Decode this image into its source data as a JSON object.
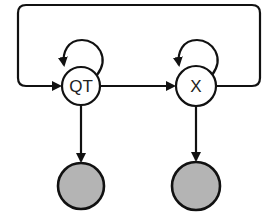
{
  "diagram": {
    "type": "graphical-model",
    "nodes": [
      {
        "id": "QT",
        "label": "QT",
        "kind": "hidden",
        "cx": 81,
        "cy": 86,
        "r": 19,
        "fill": "#ffffff"
      },
      {
        "id": "X",
        "label": "X",
        "kind": "hidden",
        "cx": 196,
        "cy": 86,
        "r": 20,
        "fill": "#ffffff"
      },
      {
        "id": "obs_QT",
        "label": "",
        "kind": "observed",
        "cx": 81,
        "cy": 186,
        "r": 23,
        "fill": "#b4b4b4"
      },
      {
        "id": "obs_X",
        "label": "",
        "kind": "observed",
        "cx": 196,
        "cy": 186,
        "r": 24,
        "fill": "#b4b4b4"
      }
    ],
    "edges": [
      {
        "from": "QT",
        "to": "QT",
        "kind": "self-loop"
      },
      {
        "from": "X",
        "to": "X",
        "kind": "self-loop"
      },
      {
        "from": "QT",
        "to": "X",
        "kind": "directed"
      },
      {
        "from": "X",
        "to": "QT",
        "kind": "feedback-loop"
      },
      {
        "from": "QT",
        "to": "obs_QT",
        "kind": "directed"
      },
      {
        "from": "X",
        "to": "obs_X",
        "kind": "directed"
      }
    ],
    "colors": {
      "stroke": "#111111",
      "observed_fill": "#b4b4b4",
      "background": "#ffffff"
    }
  }
}
